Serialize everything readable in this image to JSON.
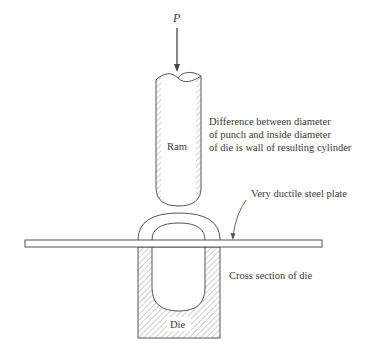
{
  "diagram": {
    "type": "deep-drawing process schematic",
    "labels": {
      "force": "P",
      "ram": "Ram",
      "die": "Die",
      "plate": "Very ductile steel plate",
      "die_section": "Cross section of die",
      "note_line1": "Difference between diameter",
      "note_line2": "of punch and inside diameter",
      "note_line3": "of die is wall of resulting cylinder"
    },
    "colors": {
      "line": "#555555",
      "hatch": "#777777",
      "background": "#ffffff"
    }
  }
}
